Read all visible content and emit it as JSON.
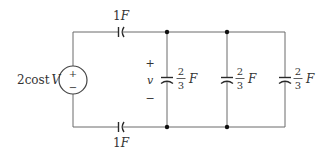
{
  "diagram": {
    "type": "circuit",
    "source": {
      "label": "2cost V",
      "label_main": "2cost",
      "label_unit": "V",
      "plus": "+",
      "minus": "−"
    },
    "series_capacitors": [
      {
        "position": "top",
        "label": "1F",
        "value": "1",
        "unit": "F"
      },
      {
        "position": "bottom",
        "label": "1F",
        "value": "1",
        "unit": "F"
      }
    ],
    "voltage": {
      "symbol": "v",
      "plus": "+",
      "minus": "−"
    },
    "shunt_capacitors": [
      {
        "label": "2/3 F",
        "numerator": "2",
        "denominator": "3",
        "unit": "F"
      },
      {
        "label": "2/3 F",
        "numerator": "2",
        "denominator": "3",
        "unit": "F"
      },
      {
        "label": "2/3 F",
        "numerator": "2",
        "denominator": "3",
        "unit": "F"
      }
    ],
    "colors": {
      "wire": "#6a6a6a",
      "text": "#333333",
      "node": "#111111"
    }
  }
}
